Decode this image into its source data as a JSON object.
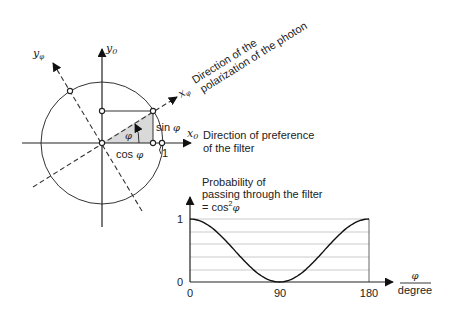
{
  "unit_circle": {
    "axes": {
      "x0_label": "x",
      "x0_sub": "0",
      "y0_label": "y",
      "y0_sub": "0",
      "xphi_label": "x",
      "xphi_sub": "φ",
      "yphi_label": "y",
      "yphi_sub": "φ"
    },
    "angle_label": "φ",
    "cos_label": "cos",
    "sin_label": "sin",
    "phi_symbol": "φ",
    "unit_label": "1",
    "polarization_annotation": {
      "line1": "Direction of the",
      "line2": "polarization of the photon"
    },
    "filter_annotation": {
      "line1": "Direction of preference",
      "line2": "of the filter"
    },
    "angle_deg": 32,
    "triangle_fill": "#d9d9d9"
  },
  "probability_chart": {
    "title_line1": "Probability of",
    "title_line2": "passing through the filter",
    "title_line3_prefix": "= cos",
    "title_line3_sup": "2",
    "title_line3_var": "φ",
    "x_unit_numerator": "φ",
    "x_unit_denominator": "degree"
  },
  "chart_data": {
    "type": "line",
    "xlabel": "φ / degree",
    "ylabel": "Probability",
    "x_ticks": [
      "0",
      "90",
      "180"
    ],
    "y_ticks": [
      "0",
      "1"
    ],
    "xlim": [
      0,
      180
    ],
    "ylim": [
      0,
      1
    ],
    "grid": "horizontal, step 0.2",
    "series": [
      {
        "name": "cos²φ",
        "x": [
          0,
          15,
          30,
          45,
          60,
          75,
          90,
          105,
          120,
          135,
          150,
          165,
          180
        ],
        "values": [
          1.0,
          0.933,
          0.75,
          0.5,
          0.25,
          0.067,
          0.0,
          0.067,
          0.25,
          0.5,
          0.75,
          0.933,
          1.0
        ]
      }
    ]
  }
}
